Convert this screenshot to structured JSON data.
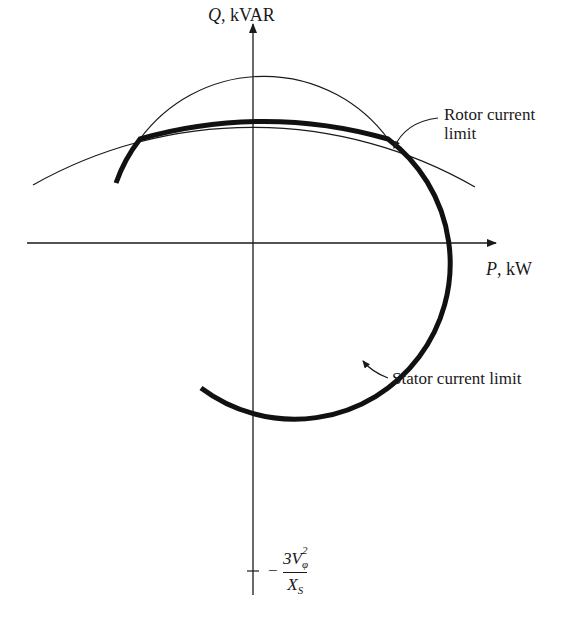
{
  "diagram": {
    "axes": {
      "y_axis": {
        "var": "Q",
        "unit": ", kVAR"
      },
      "x_axis": {
        "var": "P",
        "unit": ", kW"
      },
      "y_tick": {
        "sign": "−",
        "numerator": "3V",
        "num_sub": "φ",
        "num_sup": "2",
        "denominator": "X",
        "den_sub": "S"
      }
    },
    "annotations": {
      "rotor_line1": "Rotor current",
      "rotor_line2": "limit",
      "stator": "Stator current limit"
    },
    "colors": {
      "ink": "#1a1a1a",
      "background": "#ffffff"
    }
  }
}
